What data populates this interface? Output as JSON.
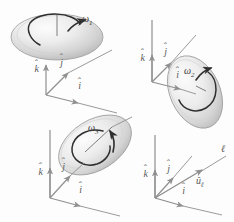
{
  "figure": {
    "background_color": "#fdfdfd",
    "axis_color": "#8a8a8a",
    "disk_edge_color": "#9a9a9a",
    "arrow_color": "#3b3b3b",
    "label_color": "#5a5a5a"
  },
  "panels": [
    {
      "id": "panel-1",
      "name": "disk-omega-1",
      "omega_label": "ω",
      "omega_subscript": "1",
      "disk_orientation": "horizontal",
      "spin_sense": "counterclockwise-viewed-from-above",
      "axes": [
        {
          "name": "k-hat",
          "label": "k̂",
          "glyph": "k",
          "direction": "up"
        },
        {
          "name": "j-hat",
          "label": "ĵ",
          "glyph": "j",
          "direction": "up-right"
        },
        {
          "name": "i-hat",
          "label": "î",
          "glyph": "i",
          "direction": "right-down"
        }
      ]
    },
    {
      "id": "panel-2",
      "name": "disk-omega-2",
      "omega_label": "ω",
      "omega_subscript": "2",
      "disk_orientation": "tilted-steep",
      "spin_sense": "counterclockwise",
      "axes": [
        {
          "name": "k-hat",
          "label": "k̂",
          "glyph": "k",
          "direction": "up"
        },
        {
          "name": "j-hat",
          "label": "ĵ",
          "glyph": "j",
          "direction": "up-right"
        },
        {
          "name": "i-hat",
          "label": "î",
          "glyph": "i",
          "direction": "right-down"
        }
      ]
    },
    {
      "id": "panel-3",
      "name": "disk-omega-3",
      "omega_label": "ω",
      "omega_subscript": "3",
      "disk_orientation": "tilted-oblique",
      "spin_sense": "counterclockwise",
      "axes": [
        {
          "name": "k-hat",
          "label": "k̂",
          "glyph": "k",
          "direction": "up"
        },
        {
          "name": "j-hat",
          "label": "ĵ",
          "glyph": "j",
          "direction": "up-right"
        },
        {
          "name": "i-hat",
          "label": "î",
          "glyph": "i",
          "direction": "right-down"
        }
      ]
    },
    {
      "id": "panel-4",
      "name": "line-axis-ell",
      "line_label": "ℓ",
      "unit_vector_label": "û",
      "unit_vector_subscript": "ℓ",
      "axes": [
        {
          "name": "k-hat",
          "label": "k̂",
          "glyph": "k",
          "direction": "up"
        },
        {
          "name": "j-hat",
          "label": "ĵ",
          "glyph": "j",
          "direction": "up-right"
        },
        {
          "name": "i-hat",
          "label": "î",
          "glyph": "i",
          "direction": "right-down"
        }
      ]
    }
  ],
  "glyphs": {
    "k": "k",
    "j": "j",
    "i": "i",
    "u": "u",
    "omega": "ω",
    "ell": "ℓ",
    "hat": "ˆ",
    "one": "1",
    "two": "2",
    "three": "3"
  }
}
